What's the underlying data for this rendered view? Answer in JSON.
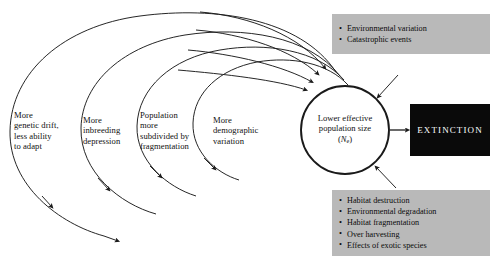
{
  "diagram": {
    "center_node": {
      "line1": "Lower effective",
      "line2": "population size",
      "symbol_open": "(",
      "symbol_var": "N",
      "symbol_sub": "e",
      "symbol_close": ")"
    },
    "ring_labels": [
      {
        "name": "genetic-drift",
        "lines": [
          "More",
          "genetic drift,",
          "less ability",
          "to adapt"
        ]
      },
      {
        "name": "inbreeding",
        "lines": [
          "More",
          "inbreeding",
          "depression"
        ]
      },
      {
        "name": "fragmentation",
        "lines": [
          "Population",
          "more",
          "subdivided by",
          "fragmentation"
        ]
      },
      {
        "name": "demographic",
        "lines": [
          "More",
          "demographic",
          "variation"
        ]
      }
    ],
    "top_factors": {
      "items": [
        "Environmental variation",
        "Catastrophic events"
      ]
    },
    "bottom_factors": {
      "items": [
        "Habitat destruction",
        "Environmental degradation",
        "Habitat fragmentation",
        "Over harvesting",
        "Effects of exotic species"
      ]
    },
    "outcome": {
      "label": "EXTINCTION"
    },
    "colors": {
      "stroke": "#1a1a1a",
      "box_gray": "#b9b9b9",
      "outcome_bg": "#0a0a0a",
      "outcome_fg": "#ffffff",
      "page_bg": "#ffffff"
    }
  }
}
